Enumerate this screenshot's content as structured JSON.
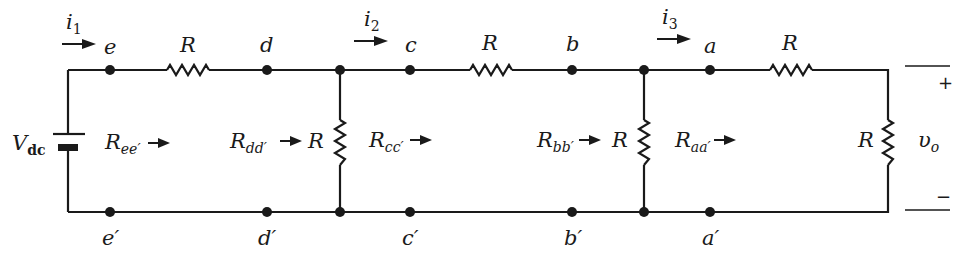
{
  "figure": {
    "type": "resistor ladder network",
    "source": {
      "label": "V",
      "subscript": "dc"
    },
    "currents": [
      {
        "label": "i",
        "subscript": "1"
      },
      {
        "label": "i",
        "subscript": "2"
      },
      {
        "label": "i",
        "subscript": "3"
      }
    ],
    "top_nodes": [
      "e",
      "d",
      "c",
      "b",
      "a"
    ],
    "bottom_nodes": [
      "e′",
      "d′",
      "c′",
      "b′",
      "a′"
    ],
    "resistor_label": "R",
    "series_resistors": [
      {
        "label": "R"
      },
      {
        "label": "R"
      },
      {
        "label": "R"
      }
    ],
    "shunt_resistors": [
      {
        "label": "R"
      },
      {
        "label": "R"
      },
      {
        "label": "R"
      }
    ],
    "equivalent_resistances": [
      {
        "label": "R",
        "subscript": "ee′"
      },
      {
        "label": "R",
        "subscript": "dd′"
      },
      {
        "label": "R",
        "subscript": "cc′"
      },
      {
        "label": "R",
        "subscript": "bb′"
      },
      {
        "label": "R",
        "subscript": "aa′"
      }
    ],
    "output": {
      "label": "υ",
      "subscript": "o",
      "plus": "+",
      "minus": "−"
    }
  }
}
